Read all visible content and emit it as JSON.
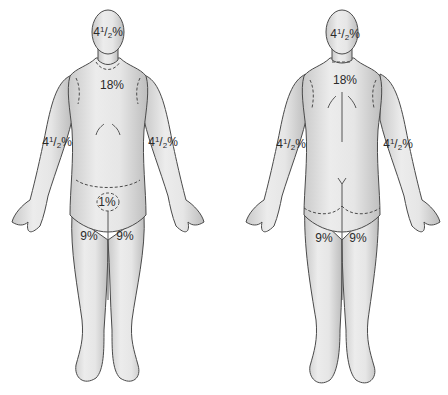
{
  "diagram": {
    "type": "rule-of-nines-body-surface-area",
    "colors": {
      "body_fill": "#e3e3e3",
      "body_stroke": "#4a4a4a",
      "label": "#2a2a2a",
      "background": "#ffffff"
    },
    "front_view": {
      "head": {
        "whole": "4",
        "num": "1",
        "den": "2",
        "pct": "%"
      },
      "trunk": "18%",
      "left_arm": {
        "whole": "4",
        "num": "1",
        "den": "2",
        "pct": "%"
      },
      "right_arm": {
        "whole": "4",
        "num": "1",
        "den": "2",
        "pct": "%"
      },
      "perineum": "1%",
      "left_leg": "9%",
      "right_leg": "9%"
    },
    "back_view": {
      "head": {
        "whole": "4",
        "num": "1",
        "den": "2",
        "pct": "%"
      },
      "trunk": "18%",
      "left_arm": {
        "whole": "4",
        "num": "1",
        "den": "2",
        "pct": "%"
      },
      "right_arm": {
        "whole": "4",
        "num": "1",
        "den": "2",
        "pct": "%"
      },
      "left_leg": "9%",
      "right_leg": "9%"
    }
  }
}
